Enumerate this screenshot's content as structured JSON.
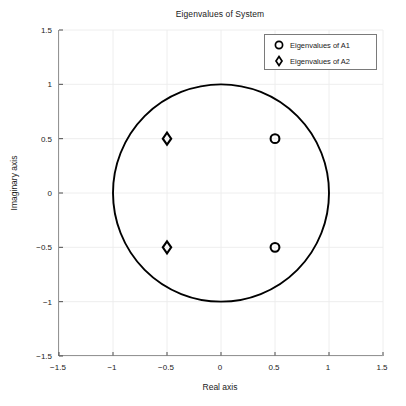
{
  "chart_data": {
    "type": "scatter",
    "title": "Eigenvalues of System",
    "xlabel": "Real axis",
    "ylabel": "Imaginary axis",
    "xlim": [
      -1.5,
      1.5
    ],
    "ylim": [
      -1.5,
      1.5
    ],
    "xticks": [
      "-1.5",
      "-1",
      "-0.5",
      "0",
      "0.5",
      "1",
      "1.5"
    ],
    "xtick_values": [
      -1.5,
      -1,
      -0.5,
      0,
      0.5,
      1,
      1.5
    ],
    "yticks": [
      "1.5",
      "1",
      "0.5",
      "0",
      "-0.5",
      "-1",
      "-1.5"
    ],
    "ytick_values": [
      1.5,
      1,
      0.5,
      0,
      -0.5,
      -1,
      -1.5
    ],
    "grid": true,
    "legend_position": "upper right",
    "series": [
      {
        "name": "Eigenvalues of A1",
        "marker": "circle",
        "color": "#000000",
        "points": [
          {
            "x": 0.5,
            "y": 0.5
          },
          {
            "x": 0.5,
            "y": -0.5
          }
        ]
      },
      {
        "name": "Eigenvalues of A2",
        "marker": "diamond",
        "color": "#000000",
        "points": [
          {
            "x": -0.5,
            "y": 0.5
          },
          {
            "x": -0.5,
            "y": -0.5
          }
        ]
      }
    ],
    "annotations": [
      {
        "name": "unit-circle",
        "type": "circle",
        "center": {
          "x": 0,
          "y": 0
        },
        "radius": 1,
        "color": "#000000",
        "filled": false
      }
    ]
  },
  "legend": {
    "items": [
      {
        "label": "Eigenvalues of A1",
        "marker": "circle-icon"
      },
      {
        "label": "Eigenvalues of A2",
        "marker": "diamond-icon"
      }
    ]
  },
  "axis": {
    "x_title": "Real axis",
    "y_title": "Imaginary axis",
    "x_tick_labels": [
      "-1.5",
      "-1",
      "-0.5",
      "0",
      "0.5",
      "1",
      "1.5"
    ],
    "y_tick_labels": [
      "1.5",
      "1",
      "0.5",
      "0",
      "-0.5",
      "-1",
      "-1.5"
    ]
  },
  "colors": {
    "background": "#ffffff",
    "axis": "#4d4d4d",
    "grid": "#ececec",
    "marker": "#000000",
    "text": "#1a1a1a"
  }
}
